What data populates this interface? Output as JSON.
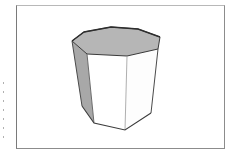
{
  "figure": {
    "shape": "octagonal-prism",
    "colors": {
      "top_face": "#b5b5b5",
      "left_face": "#a6a6a6",
      "front_faces": "#ffffff",
      "edges": "#3c3c3c",
      "frame_border": "#8c8c8c",
      "background": "#ffffff"
    },
    "top_face_vertices": [
      [
        72,
        41
      ],
      [
        84,
        32
      ],
      [
        111,
        27
      ],
      [
        138,
        29
      ],
      [
        160,
        37
      ],
      [
        158,
        49
      ],
      [
        127,
        56
      ],
      [
        87,
        54
      ]
    ],
    "bottom_visible_vertices": [
      [
        82,
        106
      ],
      [
        94,
        123
      ],
      [
        125,
        130
      ],
      [
        151,
        113
      ]
    ],
    "side_tick_count": 8
  }
}
